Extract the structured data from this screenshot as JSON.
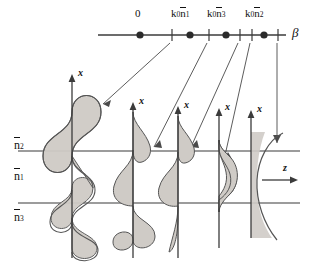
{
  "figure": {
    "type": "waveguide-mode-diagram",
    "background": "#ffffff",
    "line_color": "#3b3b3b",
    "fill_color": "#cfcbc6",
    "fill_stroke": "#555555"
  },
  "beta_axis": {
    "name": "beta-axis",
    "label": "β",
    "origin_label": "0",
    "ticks": [
      {
        "id": "zero",
        "label": "0",
        "x": 140,
        "dot": true,
        "tick": false
      },
      {
        "id": "t1",
        "label": "",
        "x": 172,
        "dot": false,
        "tick": true
      },
      {
        "id": "k0n1",
        "label": "k₀n̄₁",
        "x": 190,
        "dot": true,
        "tick": false
      },
      {
        "id": "t2",
        "label": "",
        "x": 209,
        "dot": false,
        "tick": true
      },
      {
        "id": "k0n3",
        "label": "k₀n̄₃",
        "x": 226,
        "dot": true,
        "tick": false
      },
      {
        "id": "t3",
        "label": "",
        "x": 240,
        "dot": false,
        "tick": true
      },
      {
        "id": "t4",
        "label": "",
        "x": 252,
        "dot": false,
        "tick": true
      },
      {
        "id": "k0n2",
        "label": "k₀n̄₂",
        "x": 264,
        "dot": true,
        "tick": false
      },
      {
        "id": "t5",
        "label": "",
        "x": 278,
        "dot": false,
        "tick": true
      }
    ],
    "tick_labels": [
      {
        "base": "k",
        "sub0": "0",
        "n": "n",
        "sub": "1",
        "text": "k₀n̄₁",
        "x": 190
      },
      {
        "base": "k",
        "sub0": "0",
        "n": "n",
        "sub": "3",
        "text": "k₀n̄₃",
        "x": 226
      },
      {
        "base": "k",
        "sub0": "0",
        "n": "n",
        "sub": "2",
        "text": "k₀n̄₂",
        "x": 264
      }
    ]
  },
  "layers": [
    {
      "id": "cover",
      "label": "n̄₂",
      "index_sub": "2",
      "region": "above-top-boundary"
    },
    {
      "id": "guide",
      "label": "n̄₁",
      "index_sub": "1",
      "region": "between-boundaries"
    },
    {
      "id": "substrate",
      "label": "n̄₃",
      "index_sub": "3",
      "region": "below-bottom-boundary"
    }
  ],
  "boundaries": {
    "top_y": 151,
    "bottom_y": 203
  },
  "z_axis": {
    "label": "z",
    "name": "z-axis-arrow"
  },
  "profiles": [
    {
      "id": "p1",
      "axis_label": "x",
      "kind": "radiation-mode-both-sides",
      "axis_x": 72
    },
    {
      "id": "p2",
      "axis_label": "x",
      "kind": "substrate-radiation-mode",
      "axis_x": 133
    },
    {
      "id": "p3",
      "axis_label": "x",
      "kind": "guided-mode-second-order",
      "axis_x": 178
    },
    {
      "id": "p4",
      "axis_label": "x",
      "kind": "guided-mode-fundamental",
      "axis_x": 219
    },
    {
      "id": "p5",
      "axis_label": "x",
      "kind": "evanescent-nonphysical-mode",
      "axis_x": 251
    }
  ],
  "leader_lines": [
    {
      "from_tick": "t1",
      "to_profile": "p1"
    },
    {
      "from_tick": "t2",
      "to_profile": "p2"
    },
    {
      "from_tick": "t3",
      "to_profile": "p3"
    },
    {
      "from_tick": "t4",
      "to_profile": "p4"
    },
    {
      "from_tick": "t5",
      "to_profile": "p5"
    }
  ]
}
